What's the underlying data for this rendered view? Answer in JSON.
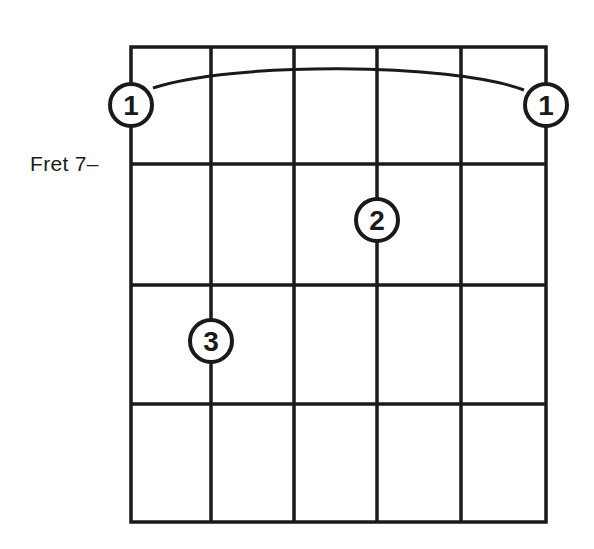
{
  "diagram": {
    "type": "guitar-chord-diagram",
    "fret_label": "Fret 7–",
    "strings": 6,
    "frets_shown": 4,
    "barre": {
      "finger": "1",
      "from_string": 1,
      "to_string": 6
    },
    "fingers": [
      {
        "label": "1",
        "string": 1,
        "position": "barre-left"
      },
      {
        "label": "1",
        "string": 6,
        "position": "barre-right"
      },
      {
        "label": "2",
        "string": 4,
        "fret_row": 1
      },
      {
        "label": "3",
        "string": 2,
        "fret_row": 2
      }
    ],
    "colors": {
      "line": "#1a1a1a",
      "background": "#ffffff"
    }
  }
}
